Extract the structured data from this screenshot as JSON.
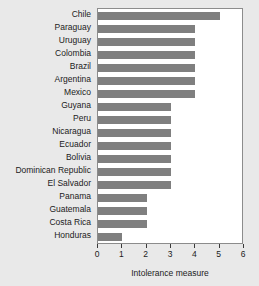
{
  "chart_data": {
    "type": "bar",
    "orientation": "horizontal",
    "title": "",
    "xlabel": "Intolerance measure",
    "ylabel": "",
    "xlim": [
      0,
      6
    ],
    "xticks": [
      0,
      1,
      2,
      3,
      4,
      5,
      6
    ],
    "grid": false,
    "legend": null,
    "bar_color": "#7f7f7f",
    "plot_background": "#ffffff",
    "page_background": "#e9e9e9",
    "categories": [
      "Chile",
      "Paraguay",
      "Uruguay",
      "Colombia",
      "Brazil",
      "Argentina",
      "Mexico",
      "Guyana",
      "Peru",
      "Nicaragua",
      "Ecuador",
      "Bolivia",
      "Dominican Republic",
      "El Salvador",
      "Panama",
      "Guatemala",
      "Costa Rica",
      "Honduras"
    ],
    "values": [
      5,
      4,
      4,
      4,
      4,
      4,
      4,
      3,
      3,
      3,
      3,
      3,
      3,
      3,
      2,
      2,
      2,
      1
    ]
  }
}
